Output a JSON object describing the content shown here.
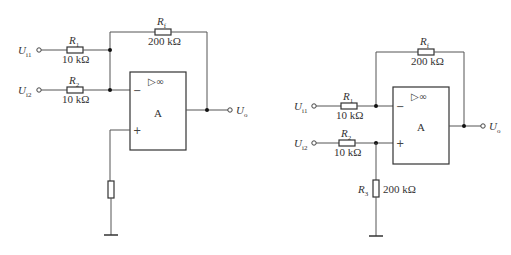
{
  "left_circuit": {
    "inputs": [
      {
        "label": "U",
        "sub": "i1"
      },
      {
        "label": "U",
        "sub": "i2"
      }
    ],
    "r1": {
      "name": "R",
      "sub": "1",
      "value": "10 kΩ"
    },
    "r2": {
      "name": "R",
      "sub": "2",
      "value": "10 kΩ"
    },
    "rf": {
      "name": "R",
      "sub": "f",
      "value": "200 kΩ"
    },
    "opamp": {
      "symbol": "▷∞",
      "label": "A",
      "minus": "−",
      "plus": "+"
    },
    "output": {
      "label": "U",
      "sub": "o"
    }
  },
  "right_circuit": {
    "inputs": [
      {
        "label": "U",
        "sub": "i1"
      },
      {
        "label": "U",
        "sub": "i2"
      }
    ],
    "r1": {
      "name": "R",
      "sub": "1",
      "value": "10 kΩ"
    },
    "r2": {
      "name": "R",
      "sub": "2",
      "value": "10 kΩ"
    },
    "r3": {
      "name": "R",
      "sub": "3",
      "value": "200 kΩ"
    },
    "rf": {
      "name": "R",
      "sub": "f",
      "value": "200 kΩ"
    },
    "opamp": {
      "symbol": "▷∞",
      "label": "A",
      "minus": "−",
      "plus": "+"
    },
    "output": {
      "label": "U",
      "sub": "o"
    }
  }
}
